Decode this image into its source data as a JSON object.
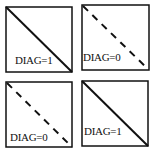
{
  "panels": [
    {
      "id": "top-left",
      "label": "DIAG=1",
      "diagonal": "solid"
    },
    {
      "id": "top-right",
      "label": "DIAG=0",
      "diagonal": "dashed"
    },
    {
      "id": "bottom-left",
      "label": "DIAG=0",
      "diagonal": "dashed"
    },
    {
      "id": "bottom-right",
      "label": "DIAG=1",
      "diagonal": "solid"
    }
  ],
  "colors": {
    "stroke": "#111111",
    "background": "#ffffff"
  }
}
